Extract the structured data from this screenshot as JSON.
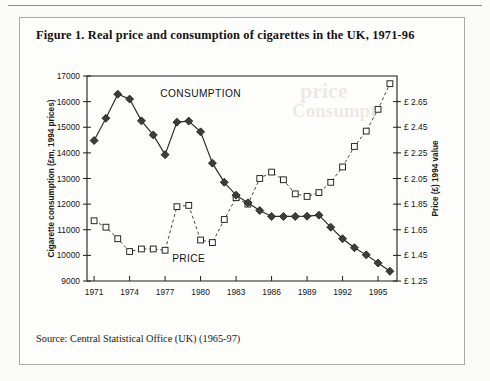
{
  "figure": {
    "title": "Figure 1. Real price and consumption of cigarettes in the UK, 1971-96",
    "source": "Source: Central Statistical Office (UK) (1965-97)"
  },
  "ghost_text": {
    "line1": "price",
    "line2": "Consumpt"
  },
  "chart_data": {
    "type": "line",
    "title": "Figure 1. Real price and consumption of cigarettes in the UK, 1971-96",
    "xlabel": "Year",
    "ylabel": "Cigarette consumption (£m, 1994 prices)",
    "y2label": "Price (£) 1994 value",
    "grid": false,
    "legend_position": "inline-annotations",
    "x": [
      1971,
      1972,
      1973,
      1974,
      1975,
      1976,
      1977,
      1978,
      1979,
      1980,
      1981,
      1982,
      1983,
      1984,
      1985,
      1986,
      1987,
      1988,
      1989,
      1990,
      1991,
      1992,
      1993,
      1994,
      1995,
      1996
    ],
    "xlim": [
      1970.4,
      1996.6
    ],
    "ylim": [
      9000,
      17000
    ],
    "yticks": [
      9000,
      10000,
      11000,
      12000,
      13000,
      14000,
      15000,
      16000,
      17000
    ],
    "ytick_labels": [
      "9000",
      "10000",
      "11000",
      "12000",
      "13000",
      "14000",
      "15000",
      "16000",
      "17000"
    ],
    "xticks": [
      1971,
      1974,
      1977,
      1980,
      1983,
      1986,
      1989,
      1992,
      1995
    ],
    "xtick_labels": [
      "1971",
      "1974",
      "1977",
      "1980",
      "1983",
      "1986",
      "1989",
      "1992",
      "1995"
    ],
    "y2lim": [
      1.25,
      2.85
    ],
    "y2ticks": [
      1.25,
      1.45,
      1.65,
      1.85,
      2.05,
      2.25,
      2.45,
      2.65
    ],
    "y2tick_labels": [
      "£ 1.25",
      "£ 1.45",
      "£ 1.65",
      "£ 1.85",
      "£ 2.05",
      "£ 2.25",
      "£ 2.45",
      "£ 2.65"
    ],
    "series": [
      {
        "name": "CONSUMPTION",
        "axis": "left",
        "marker": "filled-diamond",
        "line_style": "solid",
        "values": [
          14480,
          15350,
          16290,
          16100,
          15250,
          14700,
          13930,
          15200,
          15240,
          14820,
          13600,
          12850,
          12350,
          12050,
          11750,
          11520,
          11520,
          11520,
          11530,
          11570,
          11100,
          10650,
          10300,
          10020,
          9700,
          9380
        ]
      },
      {
        "name": "PRICE",
        "axis": "right",
        "marker": "open-square",
        "line_style": "dashed",
        "values": [
          1.72,
          1.67,
          1.58,
          1.48,
          1.5,
          1.5,
          1.49,
          1.83,
          1.84,
          1.57,
          1.55,
          1.73,
          1.9,
          1.85,
          2.05,
          2.1,
          2.04,
          1.93,
          1.91,
          1.94,
          2.02,
          2.14,
          2.3,
          2.42,
          2.59,
          2.79
        ]
      }
    ],
    "annotations": [
      {
        "text": "CONSUMPTION",
        "x": 1980.0,
        "y": 16180,
        "axis": "left"
      },
      {
        "text": "PRICE",
        "x": 1979.0,
        "y": 9750,
        "axis": "left"
      }
    ]
  }
}
